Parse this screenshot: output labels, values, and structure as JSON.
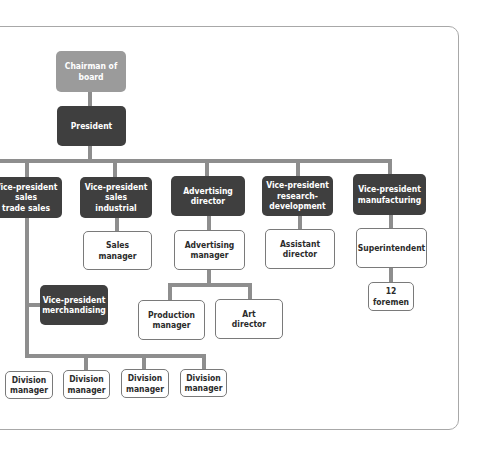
{
  "diagram": {
    "type": "organization-chart",
    "colors": {
      "top": "#9b9b9b",
      "executive": "#3f3f3f",
      "staff": "#ffffff",
      "connector": "#8e8e8e"
    },
    "nodes": {
      "chairman": "Chairman of board",
      "president": "President",
      "vp_sales_trade": "Vice-president\nsales\ntrade sales",
      "vp_sales_industrial": "Vice-president\nsales\nindustrial",
      "advertising_director": "Advertising\ndirector",
      "vp_research": "Vice-president\nresearch-\ndevelopment",
      "vp_manufacturing": "Vice-president\nmanufacturing",
      "sales_manager": "Sales\nmanager",
      "advertising_manager": "Advertising\nmanager",
      "assistant_director": "Assistant\ndirector",
      "superintendent": "Superintendent",
      "foremen": "12\nforemen",
      "vp_merchandising": "Vice-president\nmerchandising",
      "production_manager": "Production\nmanager",
      "art_director": "Art\ndirector",
      "division_managers": [
        "Division\nmanager",
        "Division\nmanager",
        "Division\nmanager",
        "Division\nmanager"
      ]
    }
  }
}
